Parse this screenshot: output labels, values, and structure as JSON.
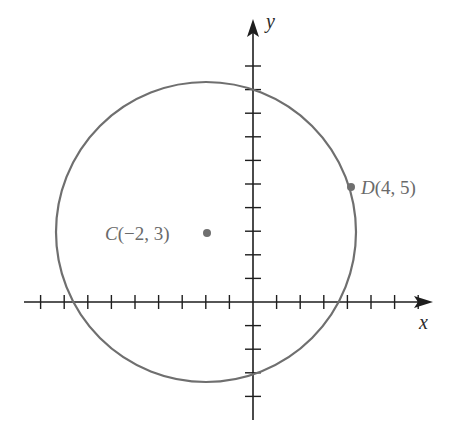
{
  "diagram": {
    "type": "coordinate-plane-circle",
    "axes": {
      "x_label": "x",
      "y_label": "y",
      "x_ticks_negative": 9,
      "x_ticks_positive": 7,
      "y_ticks_positive": 10,
      "y_ticks_negative": 4
    },
    "circle": {
      "center": [
        -2,
        3
      ],
      "passes_through": [
        4,
        5
      ],
      "radius_squared": 40
    },
    "points": [
      {
        "name": "C",
        "coords": "(−2, 3)",
        "x": -2,
        "y": 3
      },
      {
        "name": "D",
        "coords": "(4, 5)",
        "x": 4,
        "y": 5
      }
    ],
    "colors": {
      "axes": "#1e1e1e",
      "circle": "#6f6f6f",
      "labels": "#6a6a6a",
      "background": "#ffffff"
    }
  }
}
